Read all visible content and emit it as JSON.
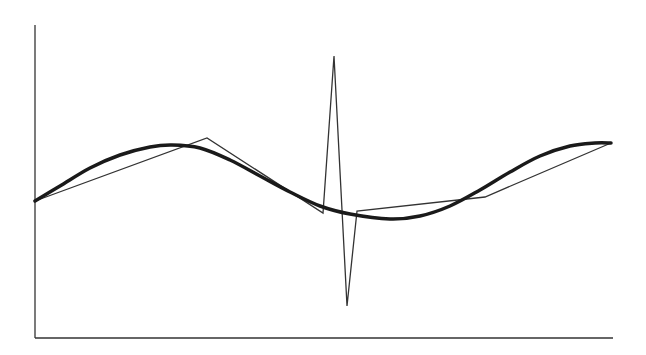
{
  "chart_data": {
    "type": "line",
    "title": "",
    "xlabel": "",
    "ylabel": "",
    "grid": false,
    "legend": null,
    "axes": {
      "x_ticks": [],
      "y_ticks": []
    },
    "series": [
      {
        "name": "smooth-curve",
        "style": "thick",
        "color": "#1a1a1a",
        "points": [
          [
            35,
            201
          ],
          [
            60,
            186
          ],
          [
            90,
            168
          ],
          [
            120,
            155
          ],
          [
            150,
            147
          ],
          [
            172,
            145
          ],
          [
            200,
            148
          ],
          [
            230,
            160
          ],
          [
            260,
            176
          ],
          [
            290,
            192
          ],
          [
            320,
            206
          ],
          [
            350,
            214
          ],
          [
            390,
            219
          ],
          [
            420,
            216
          ],
          [
            450,
            206
          ],
          [
            480,
            190
          ],
          [
            510,
            172
          ],
          [
            540,
            156
          ],
          [
            570,
            146
          ],
          [
            595,
            143
          ],
          [
            611,
            143
          ]
        ]
      },
      {
        "name": "piecewise-approximation",
        "style": "thin",
        "color": "#333333",
        "points": [
          [
            35,
            201
          ],
          [
            207,
            138
          ],
          [
            323,
            213
          ],
          [
            334,
            56
          ],
          [
            347,
            306
          ],
          [
            357,
            211
          ],
          [
            485,
            197
          ],
          [
            611,
            143
          ]
        ]
      }
    ],
    "frame": {
      "x0": 35,
      "y0": 25,
      "x1": 613,
      "y1": 338
    }
  }
}
